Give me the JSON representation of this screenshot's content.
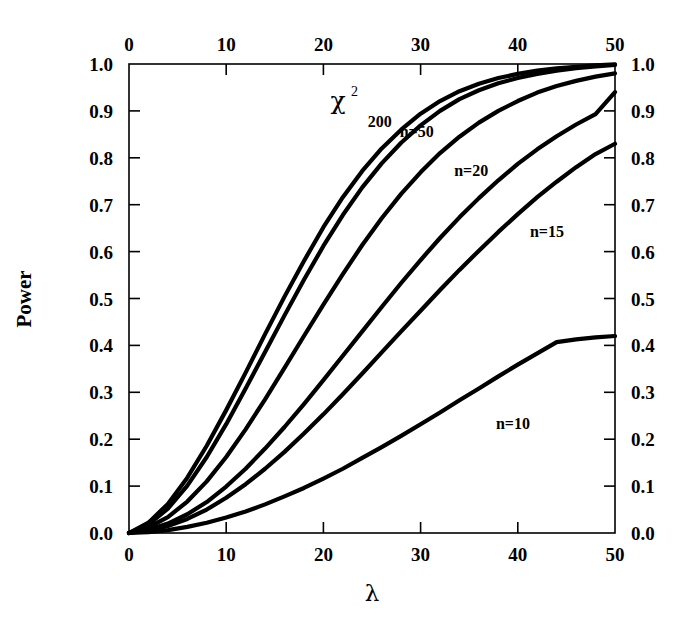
{
  "chart_data": {
    "type": "line",
    "title": "",
    "xlabel": "λ",
    "ylabel": "Power",
    "xlim": [
      0,
      50
    ],
    "ylim": [
      0.0,
      1.0
    ],
    "grid": false,
    "legend": "inline-curve-labels",
    "x_ticks": [
      0,
      10,
      20,
      30,
      40,
      50
    ],
    "x_tick_labels": [
      "0",
      "10",
      "20",
      "30",
      "40",
      "50"
    ],
    "y_ticks": [
      0.0,
      0.1,
      0.2,
      0.3,
      0.4,
      0.5,
      0.6,
      0.7,
      0.8,
      0.9,
      1.0
    ],
    "y_tick_labels": [
      "0.0",
      "0.1",
      "0.2",
      "0.3",
      "0.4",
      "0.5",
      "0.6",
      "0.7",
      "0.8",
      "0.9",
      "1.0"
    ],
    "top_axis_ticks": [
      0,
      10,
      20,
      30,
      40,
      50
    ],
    "top_axis_tick_labels": [
      "0",
      "10",
      "20",
      "30",
      "40",
      "50"
    ],
    "right_axis_tick_labels": [
      "0.0",
      "0.1",
      "0.2",
      "0.3",
      "0.4",
      "0.5",
      "0.6",
      "0.7",
      "0.8",
      "0.9",
      "1.0"
    ],
    "x": [
      0,
      2,
      4,
      6,
      8,
      10,
      12,
      14,
      16,
      18,
      20,
      22,
      24,
      26,
      28,
      30,
      32,
      34,
      36,
      38,
      40,
      42,
      44,
      46,
      48,
      50
    ],
    "series": [
      {
        "name": "χ²",
        "label": "χ",
        "label_sup": "2",
        "label_x": 21.5,
        "label_y": 0.905,
        "values": [
          0.0,
          0.022,
          0.062,
          0.118,
          0.186,
          0.262,
          0.342,
          0.424,
          0.504,
          0.58,
          0.652,
          0.716,
          0.772,
          0.82,
          0.86,
          0.894,
          0.921,
          0.942,
          0.958,
          0.97,
          0.979,
          0.986,
          0.991,
          0.994,
          0.997,
          0.999
        ]
      },
      {
        "name": "200",
        "label": "200",
        "label_x": 25.8,
        "label_y": 0.866,
        "values": [
          0.0,
          0.018,
          0.052,
          0.101,
          0.162,
          0.232,
          0.308,
          0.386,
          0.464,
          0.54,
          0.612,
          0.678,
          0.737,
          0.788,
          0.832,
          0.869,
          0.9,
          0.925,
          0.944,
          0.959,
          0.97,
          0.979,
          0.986,
          0.991,
          0.995,
          0.998
        ]
      },
      {
        "name": "n=50",
        "label": "n=50",
        "label_x": 29.6,
        "label_y": 0.845,
        "values": [
          0.0,
          0.012,
          0.034,
          0.067,
          0.11,
          0.162,
          0.221,
          0.285,
          0.352,
          0.42,
          0.487,
          0.552,
          0.614,
          0.671,
          0.723,
          0.769,
          0.81,
          0.845,
          0.875,
          0.9,
          0.921,
          0.939,
          0.953,
          0.964,
          0.973,
          0.98
        ]
      },
      {
        "name": "n=20",
        "label": "n=20",
        "label_x": 35.2,
        "label_y": 0.762,
        "values": [
          0.0,
          0.007,
          0.02,
          0.04,
          0.066,
          0.099,
          0.137,
          0.18,
          0.226,
          0.275,
          0.326,
          0.378,
          0.43,
          0.482,
          0.533,
          0.582,
          0.629,
          0.673,
          0.714,
          0.752,
          0.787,
          0.818,
          0.846,
          0.871,
          0.893,
          0.94
        ]
      },
      {
        "name": "n=15",
        "label": "n=15",
        "label_x": 43.0,
        "label_y": 0.632,
        "values": [
          0.0,
          0.005,
          0.015,
          0.03,
          0.05,
          0.075,
          0.104,
          0.137,
          0.173,
          0.212,
          0.253,
          0.296,
          0.34,
          0.385,
          0.43,
          0.474,
          0.518,
          0.561,
          0.602,
          0.642,
          0.68,
          0.716,
          0.749,
          0.78,
          0.808,
          0.83
        ]
      },
      {
        "name": "n=10",
        "label": "n=10",
        "label_x": 39.5,
        "label_y": 0.222,
        "values": [
          0.0,
          0.002,
          0.006,
          0.013,
          0.022,
          0.033,
          0.046,
          0.061,
          0.078,
          0.096,
          0.116,
          0.137,
          0.16,
          0.183,
          0.207,
          0.232,
          0.257,
          0.283,
          0.308,
          0.334,
          0.359,
          0.383,
          0.407,
          0.413,
          0.417,
          0.42
        ]
      }
    ]
  },
  "axes": {
    "y_axis_title": "Power",
    "x_axis_title": "λ"
  }
}
